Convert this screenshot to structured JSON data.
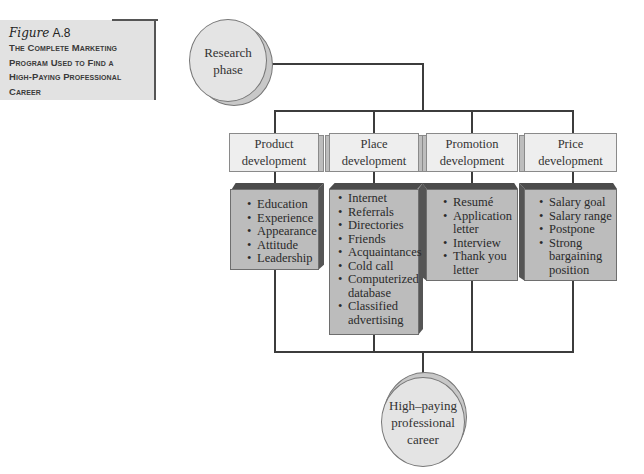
{
  "caption": {
    "figure_word": "Figure",
    "figure_number": "A.8",
    "title_lines": [
      "The Complete Marketing",
      "Program Used to Find a",
      "High-Paying Professional",
      "Career"
    ]
  },
  "start_node": {
    "label_lines": [
      "Research",
      "phase"
    ]
  },
  "end_node": {
    "label_lines": [
      "High–paying",
      "professional",
      "career"
    ]
  },
  "columns": [
    {
      "header": [
        "Product",
        "development"
      ],
      "items": [
        "Education",
        "Experience",
        "Appearance",
        "Attitude",
        "Leadership"
      ]
    },
    {
      "header": [
        "Place",
        "development"
      ],
      "items": [
        "Internet",
        "Referrals",
        "Directories",
        "Friends",
        "Acquaintances",
        "Cold call",
        "Computerized database",
        "Classified advertising"
      ]
    },
    {
      "header": [
        "Promotion",
        "development"
      ],
      "items": [
        "Resumé",
        "Application letter",
        "Interview",
        "Thank you letter"
      ]
    },
    {
      "header": [
        "Price",
        "development"
      ],
      "items": [
        "Salary goal",
        "Salary range",
        "Postpone",
        "Strong bargaining position"
      ]
    }
  ],
  "colors": {
    "line": "#3c3c3c",
    "header_fill": "#eeeeee",
    "body_fill": "#bcbcbc",
    "caption_fill": "#e2e2e2",
    "circle_fill": "#e4e4e4"
  }
}
